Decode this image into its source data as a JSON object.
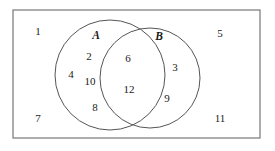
{
  "figure": {
    "type": "venn-diagram",
    "colors": {
      "stroke": "#555555",
      "rectangle_stroke": "#777777",
      "text": "#1a1a1a",
      "background": "#ffffff"
    }
  },
  "universal_set": {
    "shape": "rectangle",
    "x": 13,
    "y": 10,
    "width": 247,
    "height": 128
  },
  "circles": [
    {
      "name": "A",
      "label": "A",
      "cx": 110,
      "cy": 75,
      "r": 55,
      "label_x": 96,
      "label_y": 36
    },
    {
      "name": "B",
      "label": "B",
      "cx": 150,
      "cy": 78,
      "r": 50,
      "label_x": 159,
      "label_y": 37
    }
  ],
  "elements": {
    "a_only": [
      {
        "value": "2",
        "x": 89,
        "y": 56
      },
      {
        "value": "4",
        "x": 71,
        "y": 74
      },
      {
        "value": "10",
        "x": 90,
        "y": 81
      },
      {
        "value": "8",
        "x": 95,
        "y": 107
      }
    ],
    "intersection": [
      {
        "value": "6",
        "x": 128,
        "y": 58
      },
      {
        "value": "12",
        "x": 129,
        "y": 89
      }
    ],
    "b_only": [
      {
        "value": "3",
        "x": 175,
        "y": 67
      },
      {
        "value": "9",
        "x": 167,
        "y": 98
      }
    ],
    "outside": [
      {
        "value": "1",
        "x": 38,
        "y": 31
      },
      {
        "value": "5",
        "x": 220,
        "y": 33
      },
      {
        "value": "7",
        "x": 38,
        "y": 118
      },
      {
        "value": "11",
        "x": 220,
        "y": 118
      }
    ]
  }
}
